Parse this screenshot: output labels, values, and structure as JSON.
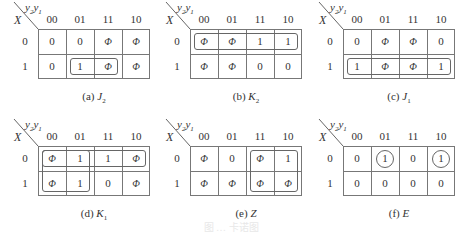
{
  "axes": {
    "row_var": "X",
    "col_var_main": "y",
    "col_var_sub1": "2",
    "col_var_sub2": "1",
    "col_headers": [
      "00",
      "01",
      "11",
      "10"
    ],
    "row_headers": [
      "0",
      "1"
    ]
  },
  "panels": [
    {
      "id": "a",
      "caption_prefix": "(a) ",
      "caption_var": "J",
      "caption_sub": "2",
      "cells": [
        [
          "0",
          "0",
          "Φ",
          "Φ"
        ],
        [
          "0",
          "1",
          "Φ",
          "Φ"
        ]
      ],
      "groups": [
        {
          "row_start": 1,
          "row_end": 1,
          "col_start": 1,
          "col_end": 2
        }
      ],
      "circles": []
    },
    {
      "id": "b",
      "caption_prefix": "(b) ",
      "caption_var": "K",
      "caption_sub": "2",
      "cells": [
        [
          "Φ",
          "Φ",
          "1",
          "1"
        ],
        [
          "Φ",
          "Φ",
          "0",
          "0"
        ]
      ],
      "groups": [
        {
          "row_start": 0,
          "row_end": 0,
          "col_start": 0,
          "col_end": 3
        }
      ],
      "circles": []
    },
    {
      "id": "c",
      "caption_prefix": "(c) ",
      "caption_var": "J",
      "caption_sub": "1",
      "cells": [
        [
          "0",
          "Φ",
          "Φ",
          "0"
        ],
        [
          "1",
          "Φ",
          "Φ",
          "1"
        ]
      ],
      "groups": [
        {
          "row_start": 1,
          "row_end": 1,
          "col_start": 0,
          "col_end": 3
        }
      ],
      "circles": []
    },
    {
      "id": "d",
      "caption_prefix": "(d) ",
      "caption_var": "K",
      "caption_sub": "1",
      "cells": [
        [
          "Φ",
          "1",
          "1",
          "Φ"
        ],
        [
          "Φ",
          "1",
          "0",
          "Φ"
        ]
      ],
      "groups": [
        {
          "row_start": 0,
          "row_end": 0,
          "col_start": 0,
          "col_end": 3
        },
        {
          "row_start": 0,
          "row_end": 1,
          "col_start": 0,
          "col_end": 1
        }
      ],
      "circles": []
    },
    {
      "id": "e",
      "caption_prefix": "(e) ",
      "caption_var": "Z",
      "caption_sub": "",
      "cells": [
        [
          "Φ",
          "0",
          "Φ",
          "1"
        ],
        [
          "Φ",
          "Φ",
          "Φ",
          "Φ"
        ]
      ],
      "groups": [
        {
          "row_start": 0,
          "row_end": 1,
          "col_start": 2,
          "col_end": 3
        }
      ],
      "circles": []
    },
    {
      "id": "f",
      "caption_prefix": "(f) ",
      "caption_var": "E",
      "caption_sub": "",
      "cells": [
        [
          "0",
          "1",
          "0",
          "1"
        ],
        [
          "0",
          "0",
          "0",
          "0"
        ]
      ],
      "groups": [],
      "circles": [
        {
          "row": 0,
          "col": 1
        },
        {
          "row": 0,
          "col": 3
        }
      ]
    }
  ],
  "figure_caption": "图 … 卡诺图"
}
